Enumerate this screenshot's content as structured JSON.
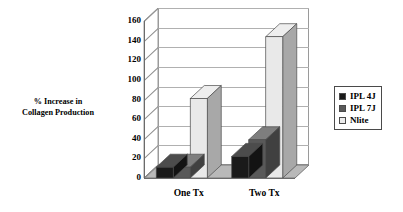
{
  "chart_data": {
    "type": "bar",
    "title": "",
    "subtitle": "",
    "xlabel": "",
    "ylabel": "% Increase in Collagen Production",
    "ylabel_line1": "% Increase in",
    "ylabel_line2": "Collagen Production",
    "categories": [
      "One Tx",
      "Two Tx"
    ],
    "series": [
      {
        "name": "IPL 4J",
        "color": "#1a1a1a",
        "values": [
          11,
          22
        ]
      },
      {
        "name": "IPL 7J",
        "color": "#595959",
        "values": [
          11,
          39
        ]
      },
      {
        "name": "Nlite",
        "color": "#e9e9e9",
        "values": [
          81,
          144
        ]
      }
    ],
    "ylim": [
      0,
      160
    ],
    "ytick_step": 20,
    "ytick_labels": [
      "0",
      "20",
      "40",
      "60",
      "80",
      "100",
      "120",
      "140",
      "160"
    ],
    "grid": true,
    "legend_position": "right",
    "style": "3d-column",
    "annotations": []
  },
  "legend": {
    "items": [
      {
        "label": "IPL 4J",
        "swatch": "#1a1a1a"
      },
      {
        "label": "IPL 7J",
        "swatch": "#595959"
      },
      {
        "label": "Nlite",
        "swatch": "#ececec"
      }
    ]
  },
  "colors": {
    "background": "#ffffff",
    "gridline": "#b0b0b0",
    "axis": "#6b6b6b",
    "floor": "#bdbdbd",
    "text": "#000000"
  }
}
